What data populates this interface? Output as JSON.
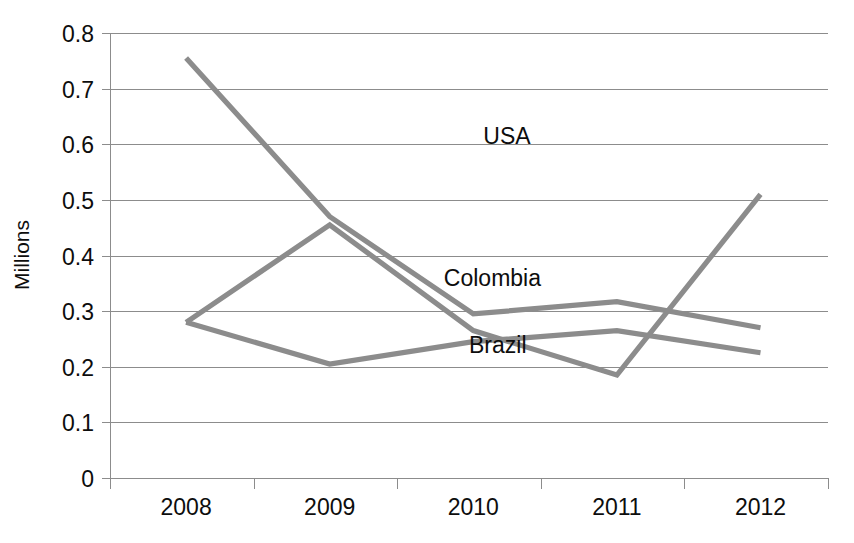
{
  "chart_data": {
    "type": "line",
    "title": "",
    "xlabel": "",
    "ylabel": "Millions",
    "categories": [
      "2008",
      "2009",
      "2010",
      "2011",
      "2012"
    ],
    "series": [
      {
        "name": "Colombia",
        "values": [
          0.755,
          0.47,
          0.295,
          0.317,
          0.27
        ],
        "color": "#8c8c8c"
      },
      {
        "name": "USA",
        "values": [
          0.28,
          0.455,
          0.265,
          0.185,
          0.51
        ],
        "color": "#8c8c8c"
      },
      {
        "name": "Brazil",
        "values": [
          0.28,
          0.205,
          0.245,
          0.265,
          0.225
        ],
        "color": "#8c8c8c"
      }
    ],
    "ylim": [
      0,
      0.8
    ],
    "y_ticks": [
      "0",
      "0.1",
      "0.2",
      "0.3",
      "0.4",
      "0.5",
      "0.6",
      "0.7",
      "0.8"
    ],
    "y_tick_values": [
      0,
      0.1,
      0.2,
      0.3,
      0.4,
      0.5,
      0.6,
      0.7,
      0.8
    ],
    "grid": true,
    "legend_position": "inline-right",
    "annotations": [
      {
        "text": "USA",
        "x": 0.52,
        "y": 0.6
      },
      {
        "text": "Colombia",
        "x": 0.465,
        "y": 0.345
      },
      {
        "text": "Brazil",
        "x": 0.5,
        "y": 0.225
      }
    ],
    "series_label_colors": "#0d0d0d",
    "axis_color": "#8c8c8c",
    "line_color": "#8c8c8c",
    "background": "#ffffff"
  },
  "axis": {
    "y_title": "Millions"
  }
}
